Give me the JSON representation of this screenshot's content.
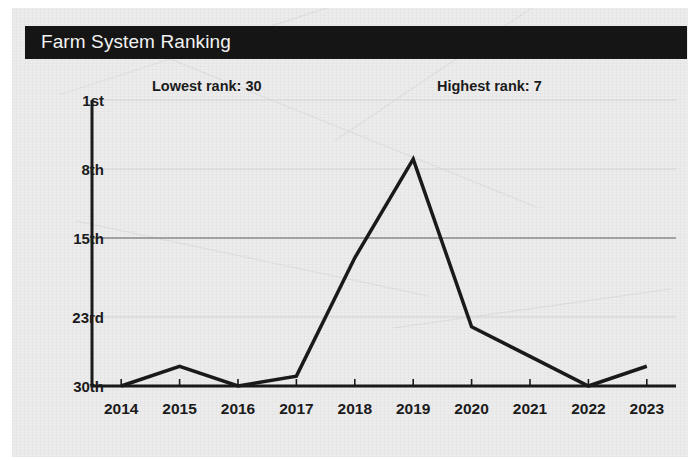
{
  "card": {
    "title": "Farm System Ranking",
    "title_bar_color": "#151515",
    "title_text_color": "#f2f2f2",
    "background_color": "#ececed"
  },
  "annotations": {
    "lowest": "Lowest rank: 30",
    "highest": "Highest rank: 7"
  },
  "chart_data": {
    "type": "line",
    "title": "Farm System Ranking",
    "xlabel": "",
    "ylabel": "",
    "x": [
      "2014",
      "2015",
      "2016",
      "2017",
      "2018",
      "2019",
      "2020",
      "2021",
      "2022",
      "2023"
    ],
    "categories": [
      "2014",
      "2015",
      "2016",
      "2017",
      "2018",
      "2019",
      "2020",
      "2021",
      "2022",
      "2023"
    ],
    "values": [
      30,
      28,
      30,
      29,
      17,
      7,
      24,
      27,
      30,
      28
    ],
    "series": [
      {
        "name": "Farm system ranking",
        "values": [
          30,
          28,
          30,
          29,
          17,
          7,
          24,
          27,
          30,
          28
        ],
        "color": "#1a1a1a",
        "line_width": 3.5
      }
    ],
    "y_inverted": true,
    "ylim": [
      1,
      30
    ],
    "y_tick_values": [
      1,
      8,
      15,
      23,
      30
    ],
    "y_tick_labels": [
      "1st",
      "8th",
      "15th",
      "23rd",
      "30th"
    ],
    "x_tick_labels": [
      "2014",
      "2015",
      "2016",
      "2017",
      "2018",
      "2019",
      "2020",
      "2021",
      "2022",
      "2023"
    ],
    "grid": true,
    "grid_color": "#d2d2d4",
    "emphasized_gridline": "15th",
    "emphasized_gridline_color": "#8a8a8e",
    "legend": "none",
    "axis_color": "#1a1a1a",
    "annotations": [
      {
        "text": "Lowest rank: 30",
        "x": "2015",
        "y": 1
      },
      {
        "text": "Highest rank: 7",
        "x": "2019",
        "y": 1
      }
    ]
  }
}
